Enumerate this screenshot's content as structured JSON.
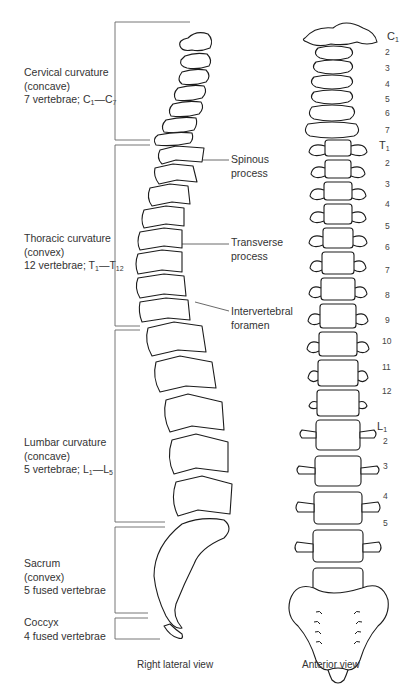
{
  "diagram": {
    "regions": [
      {
        "name": "Cervical curvature",
        "type": "(concave)",
        "count_prefix": "7 vertebrae; ",
        "first": "C",
        "first_sub": "1",
        "dash": "—",
        "last": "C",
        "last_sub": "7"
      },
      {
        "name": "Thoracic curvature",
        "type": "(convex)",
        "count_prefix": "12 vertebrae; ",
        "first": "T",
        "first_sub": "1",
        "dash": "—",
        "last": "T",
        "last_sub": "12"
      },
      {
        "name": "Lumbar curvature",
        "type": "(concave)",
        "count_prefix": "5 vertebrae; ",
        "first": "L",
        "first_sub": "1",
        "dash": "—",
        "last": "L",
        "last_sub": "5"
      },
      {
        "name": "Sacrum",
        "type": "(convex)",
        "count": "5 fused vertebrae"
      },
      {
        "name": "Coccyx",
        "count": "4 fused vertebrae"
      }
    ],
    "callouts": [
      {
        "line1": "Spinous",
        "line2": "process"
      },
      {
        "line1": "Transverse",
        "line2": "process"
      },
      {
        "line1": "Intervertebral",
        "line2": "foramen"
      }
    ],
    "anterior_labels": {
      "c1": "C",
      "c1_sub": "1",
      "cervical": [
        "2",
        "3",
        "4",
        "5",
        "6",
        "7"
      ],
      "t1": "T",
      "t1_sub": "1",
      "thoracic": [
        "2",
        "3",
        "4",
        "5",
        "6",
        "7",
        "8",
        "9",
        "10",
        "11",
        "12"
      ],
      "l1": "L",
      "l1_sub": "1",
      "lumbar": [
        "2",
        "3",
        "4",
        "5"
      ]
    },
    "captions": {
      "lateral": "Right lateral view",
      "anterior": "Anterior view"
    },
    "colors": {
      "line": "#222222",
      "bracket": "#555555",
      "background": "#ffffff"
    }
  }
}
